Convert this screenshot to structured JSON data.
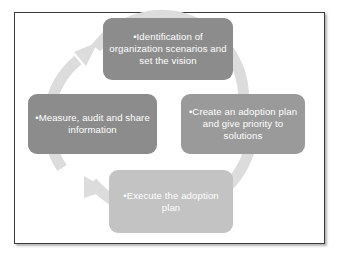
{
  "diagram": {
    "type": "cycle",
    "frame_color": "#3a3a3c",
    "background_color": "#ffffff",
    "ring": {
      "name": "circular-arrow-ring",
      "color": "#dcdcdc",
      "direction": "clockwise",
      "arrowhead_count": 2
    },
    "stages": [
      {
        "id": "identification",
        "position": "top",
        "bullet": "•",
        "text": "Identification of organization scenarios and set the vision",
        "color": "#8c8c8c",
        "text_color": "#ffffff"
      },
      {
        "id": "adoption-plan",
        "position": "right",
        "bullet": "•",
        "text": "Create an adoption plan and give priority to solutions",
        "color": "#9a9a9a",
        "text_color": "#ffffff"
      },
      {
        "id": "execute",
        "position": "bottom",
        "bullet": "•",
        "text": "Execute the adoption plan",
        "color": "#c3c3c3",
        "text_color": "#ffffff"
      },
      {
        "id": "measure",
        "position": "left",
        "bullet": "•",
        "text": "Measure, audit and share information",
        "color": "#8c8c8c",
        "text_color": "#ffffff"
      }
    ]
  }
}
